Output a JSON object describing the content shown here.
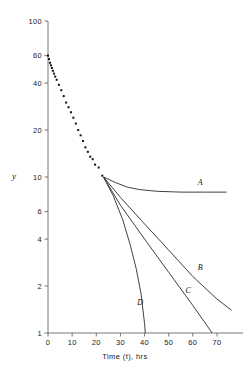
{
  "chart_data": {
    "type": "line",
    "title": "",
    "xlabel": "Time (t),  hrs",
    "ylabel": "y",
    "yscale": "log",
    "xlim": [
      0,
      75
    ],
    "ylim": [
      1,
      130
    ],
    "grid": false,
    "legend_position": "inline-curve-labels",
    "xticks": [
      0,
      10,
      20,
      30,
      40,
      50,
      60,
      70
    ],
    "xtick_labels": [
      "0",
      "10",
      "20",
      "30",
      "40",
      "50",
      "60",
      "70"
    ],
    "yticks": [
      1,
      2,
      4,
      6,
      10,
      20,
      40,
      60,
      100
    ],
    "ytick_labels": [
      "1",
      "2",
      "4",
      "6",
      "10",
      "20",
      "40",
      "60",
      "100"
    ],
    "series": [
      {
        "name": "experimental-data",
        "type": "scatter",
        "marker": "square",
        "points": [
          [
            0.0,
            60.0
          ],
          [
            0.4,
            57.0
          ],
          [
            0.8,
            54.0
          ],
          [
            1.2,
            52.0
          ],
          [
            1.6,
            50.0
          ],
          [
            2.0,
            48.0
          ],
          [
            2.5,
            46.0
          ],
          [
            3.0,
            44.0
          ],
          [
            3.6,
            42.0
          ],
          [
            4.5,
            39.0
          ],
          [
            5.5,
            36.0
          ],
          [
            6.5,
            33.0
          ],
          [
            7.5,
            30.0
          ],
          [
            8.5,
            28.0
          ],
          [
            9.5,
            26.0
          ],
          [
            10.5,
            24.0
          ],
          [
            11.5,
            22.0
          ],
          [
            12.5,
            20.0
          ],
          [
            13.5,
            18.5
          ],
          [
            14.5,
            17.0
          ],
          [
            15.5,
            15.5
          ],
          [
            16.5,
            14.5
          ],
          [
            17.5,
            13.5
          ],
          [
            18.5,
            13.0
          ],
          [
            19.5,
            12.0
          ],
          [
            21.0,
            11.5
          ],
          [
            22.5,
            10.2
          ]
        ]
      },
      {
        "name": "A",
        "label": "A",
        "type": "line",
        "label_x": 62,
        "label_y": 9.2,
        "points": [
          [
            23,
            10.0
          ],
          [
            28,
            9.2
          ],
          [
            33,
            8.6
          ],
          [
            38,
            8.3
          ],
          [
            45,
            8.1
          ],
          [
            55,
            8.0
          ],
          [
            65,
            8.0
          ],
          [
            74,
            8.0
          ]
        ]
      },
      {
        "name": "B",
        "label": "B",
        "type": "line",
        "label_x": 62,
        "label_y": 2.6,
        "points": [
          [
            23,
            10.0
          ],
          [
            30,
            7.4
          ],
          [
            40,
            5.0
          ],
          [
            50,
            3.4
          ],
          [
            60,
            2.3
          ],
          [
            70,
            1.65
          ],
          [
            76,
            1.4
          ]
        ]
      },
      {
        "name": "C",
        "label": "C",
        "type": "line",
        "label_x": 57,
        "label_y": 1.85,
        "points": [
          [
            23,
            10.0
          ],
          [
            30,
            6.6
          ],
          [
            40,
            4.0
          ],
          [
            50,
            2.45
          ],
          [
            60,
            1.5
          ],
          [
            68,
            1.0
          ]
        ]
      },
      {
        "name": "D",
        "label": "D",
        "type": "line",
        "label_x": 37,
        "label_y": 1.55,
        "points": [
          [
            23,
            10.0
          ],
          [
            27,
            7.6
          ],
          [
            31,
            5.3
          ],
          [
            34,
            3.7
          ],
          [
            36.5,
            2.6
          ],
          [
            38.5,
            1.8
          ],
          [
            40,
            1.15
          ],
          [
            40.3,
            1.0
          ]
        ]
      }
    ]
  },
  "figure": {
    "caption": ""
  }
}
